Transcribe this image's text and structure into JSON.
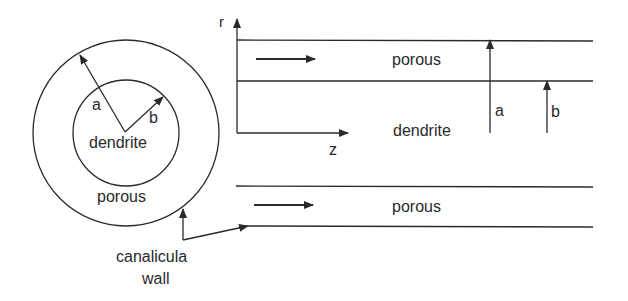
{
  "diagram": {
    "cross_section": {
      "outer_label_radius": "a",
      "inner_label_radius": "b",
      "inner_region_label": "dendrite",
      "annulus_label": "porous"
    },
    "longitudinal_section": {
      "axis_r_label": "r",
      "axis_z_label": "z",
      "top_channel_label": "porous",
      "middle_region_label": "dendrite",
      "bottom_channel_label": "porous",
      "radius_a_label": "a",
      "radius_b_label": "b"
    },
    "callout": {
      "line1": "canalicula",
      "line2": "wall"
    },
    "colors": {
      "stroke": "#2a2a2a",
      "background": "#ffffff"
    }
  }
}
